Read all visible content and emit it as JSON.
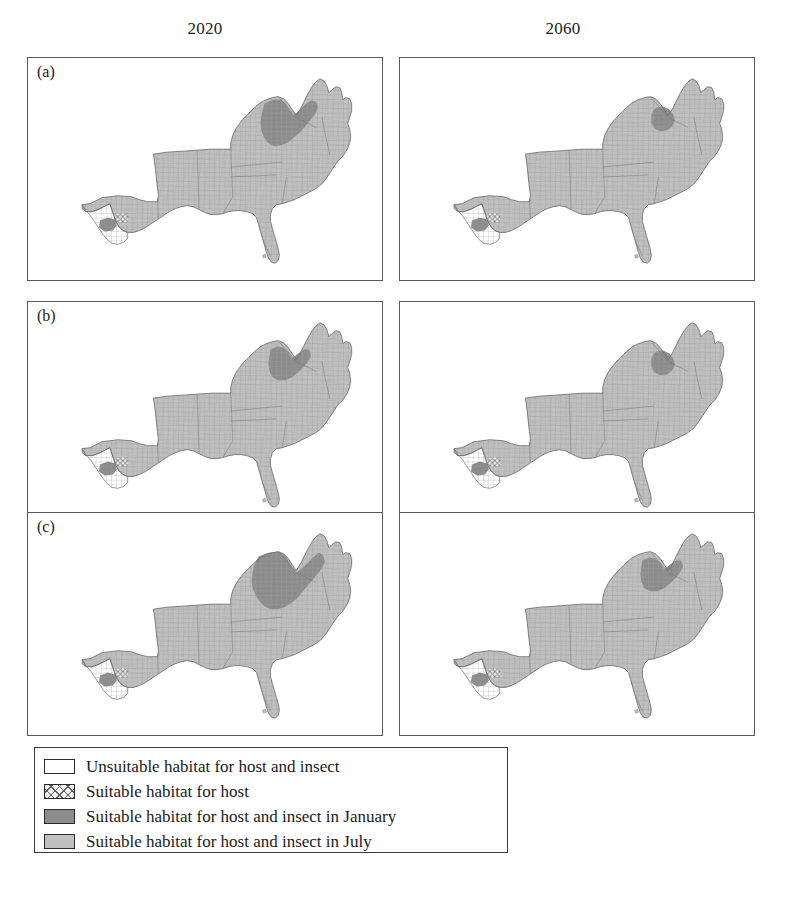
{
  "figure": {
    "type": "small-multiples-choropleth-map",
    "region": "Southeastern United States (county level)",
    "grid": {
      "rows": 3,
      "cols": 2
    },
    "column_headers": [
      "2020",
      "2060"
    ],
    "row_labels": [
      "(a)",
      "(b)",
      "(c)"
    ],
    "colors": {
      "unsuitable": "#ffffff",
      "host_only_hatch": "#e8e8e8",
      "january": "#8c8c8c",
      "july": "#c0c0c0",
      "county_line": "#9a9a9a",
      "outline": "#6e6e6e",
      "panel_border": "#5a5a5a"
    }
  },
  "legend": {
    "items": [
      {
        "swatch": "unsuitable-swatch",
        "label": "Unsuitable habitat for host and insect"
      },
      {
        "swatch": "host-hatch-swatch",
        "label": "Suitable habitat for host"
      },
      {
        "swatch": "january-swatch",
        "label": "Suitable habitat for host and insect in January"
      },
      {
        "swatch": "july-swatch",
        "label": "Suitable habitat for host and insect in July"
      }
    ]
  },
  "panels": [
    {
      "id": "panel-a-2020",
      "row_label": "(a)",
      "column": "2020",
      "january_extent": "large",
      "unsuitable_extent": "west-texas"
    },
    {
      "id": "panel-a-2060",
      "row_label": "(a)",
      "column": "2060",
      "january_extent": "small",
      "unsuitable_extent": "west-texas"
    },
    {
      "id": "panel-b-2020",
      "row_label": "(b)",
      "column": "2020",
      "january_extent": "medium",
      "unsuitable_extent": "west-texas"
    },
    {
      "id": "panel-b-2060",
      "row_label": "(b)",
      "column": "2060",
      "january_extent": "small",
      "unsuitable_extent": "west-texas"
    },
    {
      "id": "panel-c-2020",
      "row_label": "(c)",
      "column": "2020",
      "january_extent": "largest",
      "unsuitable_extent": "west-texas"
    },
    {
      "id": "panel-c-2060",
      "row_label": "(c)",
      "column": "2060",
      "january_extent": "medium",
      "unsuitable_extent": "west-texas"
    }
  ]
}
